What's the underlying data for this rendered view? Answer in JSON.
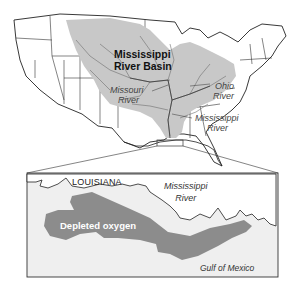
{
  "map": {
    "main_labels": {
      "basin_line1": "Mississippi",
      "basin_line2": "River Basin",
      "missouri_line1": "Missouri",
      "missouri_line2": "River",
      "ohio_line1": "Ohio",
      "ohio_line2": "River",
      "mississippi_line1": "Mississippi",
      "mississippi_line2": "River"
    },
    "inset_labels": {
      "state": "LOUISIANA",
      "river_line1": "Mississippi",
      "river_line2": "River",
      "zone": "Depleted oxygen",
      "water": "Gulf of Mexico"
    },
    "colors": {
      "basin_fill": "#c8c8c8",
      "zone_fill": "#8c8c8c",
      "land": "#ffffff",
      "water": "#efefef",
      "borders": "#222222",
      "rivers": "#6e6e6e"
    }
  }
}
